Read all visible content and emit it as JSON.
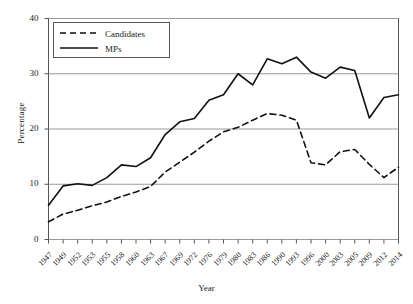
{
  "chart_data": {
    "type": "line",
    "title": "",
    "xlabel": "Year",
    "ylabel": "Percentage",
    "xlim": [
      0,
      24
    ],
    "ylim": [
      0,
      40
    ],
    "yticks": [
      0,
      10,
      20,
      30,
      40
    ],
    "grid": true,
    "legend_position": "top-left",
    "categories": [
      "1947",
      "1949",
      "1952",
      "1953",
      "1955",
      "1958",
      "1960",
      "1963",
      "1967",
      "1969",
      "1972",
      "1976",
      "1979",
      "1980",
      "1983",
      "1986",
      "1990",
      "1993",
      "1996",
      "2000",
      "2003",
      "2005",
      "2009",
      "2012",
      "2014"
    ],
    "series": [
      {
        "name": "Candidates",
        "style": "dashed",
        "color": "#111111",
        "values": [
          3.2,
          4.6,
          5.3,
          6.1,
          6.8,
          7.8,
          8.6,
          9.6,
          12.2,
          14.0,
          15.8,
          17.8,
          19.5,
          20.3,
          21.6,
          22.8,
          22.5,
          21.6,
          13.9,
          13.5,
          15.9,
          16.3,
          13.6,
          11.2,
          13.1
        ]
      },
      {
        "name": "MPs",
        "style": "solid",
        "color": "#111111",
        "values": [
          6.2,
          9.7,
          10.1,
          9.8,
          11.2,
          13.5,
          13.2,
          14.8,
          19.0,
          21.3,
          21.9,
          25.2,
          26.2,
          30.0,
          28.0,
          32.7,
          31.8,
          33.0,
          30.3,
          29.2,
          31.2,
          30.6,
          22.0,
          25.7,
          26.2
        ]
      }
    ]
  },
  "legend": {
    "items": [
      {
        "label": "Candidates",
        "style": "dashed"
      },
      {
        "label": "MPs",
        "style": "solid"
      }
    ]
  }
}
